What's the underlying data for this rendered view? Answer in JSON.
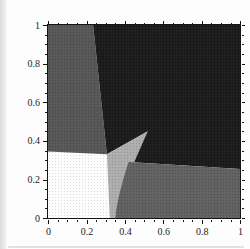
{
  "figure": {
    "kind": "scanned-region-plot",
    "frame_color": "#141414",
    "paper_color": "#fdfdfd",
    "scan_artifacts": {
      "left_strip_color": "#d9d9d9",
      "bottom_smudge_color": "#c9c9c9"
    }
  },
  "chart_data": {
    "type": "area",
    "title": "",
    "xlabel": "",
    "ylabel": "",
    "xlim": [
      0,
      1
    ],
    "ylim": [
      0,
      1
    ],
    "grid": false,
    "legend": false,
    "x_tick_values": [
      0,
      0.2,
      0.4,
      0.6,
      0.8,
      1
    ],
    "x_tick_labels": [
      "0",
      "0.2",
      "0.4",
      "0.6",
      "0.8",
      "1"
    ],
    "y_tick_values": [
      0,
      0.2,
      0.4,
      0.6,
      0.8,
      1
    ],
    "y_tick_labels": [
      "1",
      "0.8",
      "0.6",
      "0.4",
      "0.2",
      "0"
    ],
    "y_tick_labels_note": "listed top-to-bottom; values map 0-bottom to 1-top",
    "minor_tick_step": 0.05,
    "background_region_color": "#fdfdfd",
    "regions": [
      {
        "name": "top-left-gray-band",
        "color": "#565656",
        "path": [
          [
            "M",
            0,
            0.345
          ],
          [
            "L",
            0,
            1
          ],
          [
            "L",
            0.235,
            1
          ],
          [
            "L",
            0.307,
            0.33
          ],
          [
            "Z"
          ]
        ]
      },
      {
        "name": "upper-right-black-region",
        "color": "#1a1a1a",
        "path": [
          [
            "M",
            0.235,
            1
          ],
          [
            "L",
            1,
            1
          ],
          [
            "L",
            1,
            0.254
          ],
          [
            "L",
            0.42,
            0.29
          ],
          [
            "C",
            0.445,
            0.34,
            0.48,
            0.4,
            0.52,
            0.45
          ],
          [
            "L",
            0.307,
            0.33
          ],
          [
            "Z"
          ]
        ]
      },
      {
        "name": "center-light-gray-wedge",
        "color": "#adadad",
        "path": [
          [
            "M",
            0.307,
            0.33
          ],
          [
            "L",
            0.52,
            0.45
          ],
          [
            "C",
            0.44,
            0.27,
            0.36,
            0.09,
            0.35,
            0
          ],
          [
            "L",
            0.322,
            0
          ],
          [
            "Z"
          ]
        ]
      },
      {
        "name": "bottom-right-gray-band",
        "color": "#606060",
        "path": [
          [
            "M",
            0.35,
            0
          ],
          [
            "C",
            0.36,
            0.1,
            0.4,
            0.23,
            0.42,
            0.29
          ],
          [
            "L",
            1,
            0.254
          ],
          [
            "L",
            1,
            0
          ],
          [
            "Z"
          ]
        ]
      }
    ],
    "convergence_point": [
      0.52,
      0.45
    ]
  }
}
